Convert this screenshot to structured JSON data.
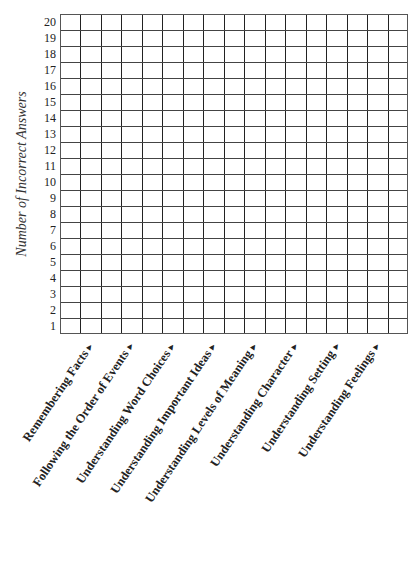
{
  "chart_data": {
    "type": "bar",
    "title": "",
    "xlabel": "",
    "ylabel": "Number of Incorrect Answers",
    "ylim": [
      0,
      20
    ],
    "yticks": [
      1,
      2,
      3,
      4,
      5,
      6,
      7,
      8,
      9,
      10,
      11,
      12,
      13,
      14,
      15,
      16,
      17,
      18,
      19,
      20
    ],
    "grid": true,
    "grid_columns": 17,
    "grid_rows": 20,
    "categories": [
      "Remembering Facts",
      "Following the Order of Events",
      "Understanding Word Choices",
      "Understanding Important Ideas",
      "Understanding Levels of Meaning",
      "Understanding Character",
      "Understanding Setting",
      "Understanding Feelings"
    ],
    "values": [
      null,
      null,
      null,
      null,
      null,
      null,
      null,
      null
    ],
    "note": "Blank graph template; no bars filled in"
  },
  "axis": {
    "ylabel": "Number of Incorrect Answers",
    "yticks": [
      "1",
      "2",
      "3",
      "4",
      "5",
      "6",
      "7",
      "8",
      "9",
      "10",
      "11",
      "12",
      "13",
      "14",
      "15",
      "16",
      "17",
      "18",
      "19",
      "20"
    ]
  },
  "categories": [
    {
      "label": "Remembering Facts",
      "arrow": "▲"
    },
    {
      "label": "Following the Order of Events",
      "arrow": "▲"
    },
    {
      "label": "Understanding Word Choices",
      "arrow": "▲"
    },
    {
      "label": "Understanding Important Ideas",
      "arrow": "▲"
    },
    {
      "label": "Understanding Levels of Meaning",
      "arrow": "▲"
    },
    {
      "label": "Understanding Character",
      "arrow": "▲"
    },
    {
      "label": "Understanding Setting",
      "arrow": "▲"
    },
    {
      "label": "Understanding Feelings",
      "arrow": "▲"
    }
  ]
}
